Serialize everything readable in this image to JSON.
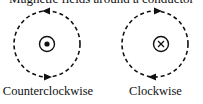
{
  "title": "Magnetic fields around a conductor",
  "diagrams": [
    {
      "label": "Counterclockwise",
      "symbol": "dot-current-out-of-page",
      "direction": "counterclockwise"
    },
    {
      "label": "Clockwise",
      "symbol": "cross-current-into-page",
      "direction": "clockwise"
    }
  ],
  "colors": {
    "stroke": "#111111",
    "background": "#ffffff"
  }
}
